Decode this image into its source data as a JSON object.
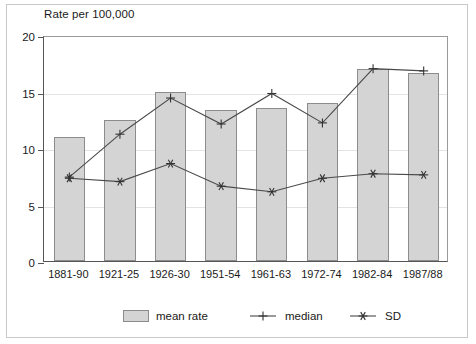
{
  "chart_data": {
    "type": "bar",
    "title": "Rate per 100,000",
    "xlabel": "",
    "ylabel": "Rate per 100,000",
    "ylim": [
      0,
      20
    ],
    "yticks": [
      0,
      5,
      10,
      15,
      20
    ],
    "ytick_labels": [
      "0",
      "5",
      "10",
      "15",
      "20"
    ],
    "grid": true,
    "legend_position": "bottom",
    "categories": [
      "1881-90",
      "1921-25",
      "1926-30",
      "1951-54",
      "1961-63",
      "1972-74",
      "1982-84",
      "1987/88"
    ],
    "series": [
      {
        "name": "mean rate",
        "type": "bar",
        "marker": "filled-box",
        "color": "#d4d4d4",
        "values": [
          11.0,
          12.5,
          15.0,
          13.4,
          13.5,
          14.0,
          17.0,
          16.6
        ]
      },
      {
        "name": "median",
        "type": "line",
        "marker": "plus",
        "color": "#4a4a4a",
        "values": [
          7.6,
          11.4,
          14.6,
          12.3,
          15.0,
          12.4,
          17.2,
          17.0
        ]
      },
      {
        "name": "SD",
        "type": "line",
        "marker": "star",
        "color": "#4a4a4a",
        "values": [
          7.5,
          7.2,
          8.8,
          6.8,
          6.3,
          7.5,
          7.9,
          7.8
        ]
      }
    ]
  },
  "legend": {
    "items": [
      {
        "label": "mean rate",
        "marker": "filled-box"
      },
      {
        "label": "median",
        "marker": "plus"
      },
      {
        "label": "SD",
        "marker": "star"
      }
    ]
  }
}
